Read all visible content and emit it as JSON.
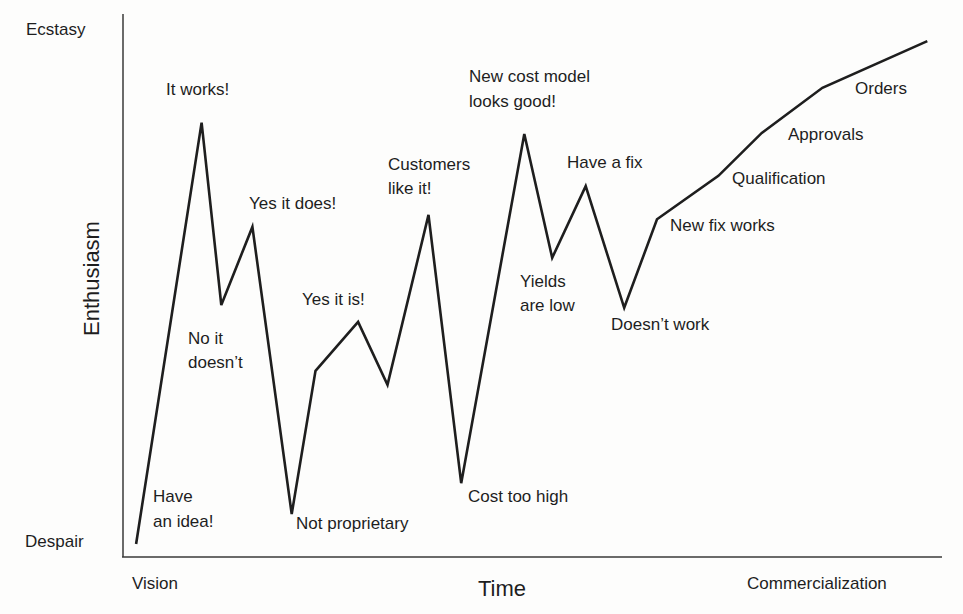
{
  "chart_data": {
    "type": "line",
    "title": "",
    "xlabel": "Time",
    "ylabel": "Enthusiasm",
    "x_tick_labels": [
      "Vision",
      "Commercialization"
    ],
    "y_tick_labels": [
      "Despair",
      "Ecstasy"
    ],
    "grid": false,
    "legend": null,
    "xlim": [
      0,
      100
    ],
    "ylim": [
      0,
      100
    ],
    "series": [
      {
        "name": "Enthusiasm",
        "points": [
          {
            "x": 1.6,
            "y": 2.4,
            "label": "Have an idea!"
          },
          {
            "x": 9.6,
            "y": 80.0,
            "label": "It works!"
          },
          {
            "x": 12.0,
            "y": 46.4,
            "label": "No it doesn't"
          },
          {
            "x": 15.8,
            "y": 60.8,
            "label": "Yes it does!"
          },
          {
            "x": 20.6,
            "y": 7.9,
            "label": "Not proprietary"
          },
          {
            "x": 23.5,
            "y": 34.3,
            "label": ""
          },
          {
            "x": 28.7,
            "y": 43.3,
            "label": "Yes it is!"
          },
          {
            "x": 32.3,
            "y": 31.7,
            "label": ""
          },
          {
            "x": 37.3,
            "y": 63.0,
            "label": "Customers like it!"
          },
          {
            "x": 41.3,
            "y": 13.6,
            "label": "Cost too high"
          },
          {
            "x": 49.0,
            "y": 77.9,
            "label": "New cost model looks good!"
          },
          {
            "x": 52.4,
            "y": 55.1,
            "label": "Yields are low"
          },
          {
            "x": 56.5,
            "y": 68.3,
            "label": "Have a fix"
          },
          {
            "x": 61.2,
            "y": 45.9,
            "label": "Doesn't work"
          },
          {
            "x": 65.2,
            "y": 62.2,
            "label": "New fix works"
          },
          {
            "x": 72.7,
            "y": 70.2,
            "label": "Qualification"
          },
          {
            "x": 78.0,
            "y": 78.1,
            "label": "Approvals"
          },
          {
            "x": 85.4,
            "y": 86.4,
            "label": "Orders"
          },
          {
            "x": 98.2,
            "y": 95.0,
            "label": ""
          }
        ]
      }
    ],
    "annotations": [
      {
        "text": "It works!",
        "lines": [
          "It works!"
        ]
      },
      {
        "text": "Yes it does!",
        "lines": [
          "Yes it does!"
        ]
      },
      {
        "text": "No it doesn't",
        "lines": [
          "No it",
          "doesn’t"
        ]
      },
      {
        "text": "Have an idea!",
        "lines": [
          "Have",
          "an idea!"
        ]
      },
      {
        "text": "Not proprietary",
        "lines": [
          "Not proprietary"
        ]
      },
      {
        "text": "Yes it is!",
        "lines": [
          "Yes it is!"
        ]
      },
      {
        "text": "Customers like it!",
        "lines": [
          "Customers",
          "like it!"
        ]
      },
      {
        "text": "Cost too high",
        "lines": [
          "Cost too high"
        ]
      },
      {
        "text": "New cost model looks good!",
        "lines": [
          "New cost model",
          "looks good!"
        ]
      },
      {
        "text": "Yields are low",
        "lines": [
          "Yields",
          "are low"
        ]
      },
      {
        "text": "Have a fix",
        "lines": [
          "Have a fix"
        ]
      },
      {
        "text": "Doesn't work",
        "lines": [
          "Doesn’t work"
        ]
      },
      {
        "text": "New fix works",
        "lines": [
          "New fix works"
        ]
      },
      {
        "text": "Qualification",
        "lines": [
          "Qualification"
        ]
      },
      {
        "text": "Approvals",
        "lines": [
          "Approvals"
        ]
      },
      {
        "text": "Orders",
        "lines": [
          "Orders"
        ]
      }
    ]
  },
  "colors": {
    "line": "#1e1e1e",
    "axis": "#3a3a3a",
    "background": "#fdfdfc"
  }
}
